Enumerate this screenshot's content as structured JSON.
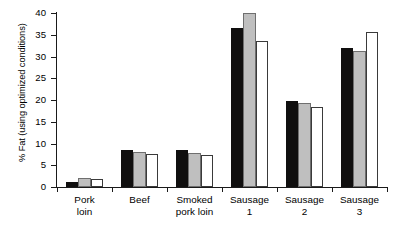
{
  "chart_data": {
    "type": "bar",
    "title": "",
    "subtitle": "",
    "xlabel": "",
    "ylabel": "% Fat (using optimized conditions)",
    "ylim": [
      0,
      40
    ],
    "yticks": [
      0,
      5,
      10,
      15,
      20,
      25,
      30,
      35,
      40
    ],
    "ytick_labels": [
      "0",
      "5",
      "10",
      "15",
      "20",
      "25",
      "30",
      "35",
      "40"
    ],
    "grid": false,
    "legend": "none",
    "categories": [
      "Pork\nloin",
      "Beef",
      "Smoked\npork loin",
      "Sausage\n1",
      "Sausage\n2",
      "Sausage\n3"
    ],
    "category_labels_flat": [
      "Pork loin",
      "Beef",
      "Smoked pork loin",
      "Sausage 1",
      "Sausage 2",
      "Sausage 3"
    ],
    "series": [
      {
        "name": "series-1",
        "color": "#100f0f",
        "fill": "black",
        "values": [
          1.2,
          8.5,
          8.4,
          36.5,
          19.8,
          32.0
        ]
      },
      {
        "name": "series-2",
        "color": "#bfbfbf",
        "fill": "gray",
        "values": [
          2.1,
          8.0,
          7.9,
          40.0,
          19.3,
          31.3
        ]
      },
      {
        "name": "series-3",
        "color": "#ffffff",
        "fill": "white",
        "values": [
          1.8,
          7.5,
          7.3,
          33.5,
          18.3,
          35.7
        ]
      }
    ]
  },
  "axis": {
    "y_title": "% Fat (using optimized conditions)"
  }
}
